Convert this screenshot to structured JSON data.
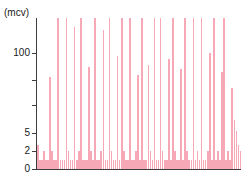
{
  "chart_data": {
    "type": "bar",
    "title": "",
    "subtitle": "",
    "xlabel": "",
    "ylabel": "(mcv)",
    "unit_label": "(mcv)",
    "grid": false,
    "legend": null,
    "yscale": "nonlinear-compressed",
    "ylim": [
      0,
      130
    ],
    "y_ticks_labeled": [
      0,
      2,
      5,
      100
    ],
    "y_ticks_unlabeled_count": 2,
    "y_tick_positions_px_from_top": {
      "100": 53,
      "unlabeled_upper": 80,
      "unlabeled_lower": 105,
      "5": 133,
      "2": 151,
      "0": 169
    },
    "bar_color": "#f7a8b6",
    "axis_color": "#3d3d3d",
    "background": "#ffffff",
    "x_tick_labels": [],
    "n_bars": 100,
    "note_clipped_top": true,
    "values": [
      3,
      1,
      1,
      2,
      1,
      1,
      55,
      2,
      1,
      1,
      130,
      1,
      1,
      1,
      130,
      2,
      1,
      1,
      120,
      1,
      2,
      130,
      1,
      1,
      1,
      75,
      2,
      1,
      130,
      1,
      1,
      2,
      118,
      1,
      1,
      130,
      2,
      1,
      1,
      95,
      1,
      130,
      2,
      1,
      1,
      130,
      1,
      1,
      2,
      60,
      1,
      130,
      1,
      1,
      78,
      2,
      1,
      130,
      1,
      1,
      130,
      2,
      1,
      1,
      88,
      1,
      130,
      2,
      1,
      1,
      70,
      1,
      130,
      2,
      1,
      1,
      130,
      1,
      2,
      1,
      128,
      1,
      1,
      2,
      100,
      1,
      130,
      1,
      2,
      1,
      64,
      130,
      1,
      2,
      1,
      40,
      12,
      6,
      3,
      2
    ],
    "values_detail": [
      {
        "i": 0,
        "v": 3
      },
      {
        "i": 1,
        "v": 1
      },
      {
        "i": 2,
        "v": 1
      },
      {
        "i": 3,
        "v": 2
      },
      {
        "i": 4,
        "v": 1
      },
      {
        "i": 5,
        "v": 1
      },
      {
        "i": 6,
        "v": 55
      },
      {
        "i": 7,
        "v": 2
      },
      {
        "i": 8,
        "v": 1
      },
      {
        "i": 9,
        "v": 1
      },
      {
        "i": 10,
        "v": 130
      },
      {
        "i": 11,
        "v": 1
      }
    ]
  },
  "axis": {
    "unit_label": "(mcv)",
    "tick_labels": [
      "100",
      "5",
      "2",
      "0"
    ]
  }
}
